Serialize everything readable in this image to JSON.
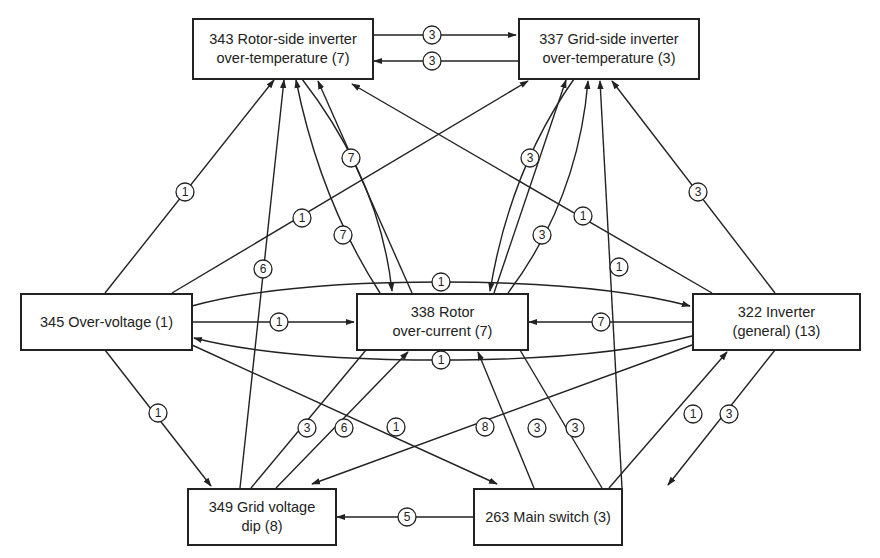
{
  "diagram": {
    "type": "fault-transition-graph",
    "nodes": [
      {
        "id": "n343",
        "line1": "343 Rotor-side inverter",
        "line2": "over-temperature (7)"
      },
      {
        "id": "n337",
        "line1": "337 Grid-side inverter",
        "line2": "over-temperature (3)"
      },
      {
        "id": "n345",
        "line1": "345 Over-voltage (1)",
        "line2": ""
      },
      {
        "id": "n338",
        "line1": "338 Rotor",
        "line2": "over-current (7)"
      },
      {
        "id": "n322",
        "line1": "322 Inverter",
        "line2": "(general) (13)"
      },
      {
        "id": "n349",
        "line1": "349 Grid voltage",
        "line2": "dip (8)"
      },
      {
        "id": "n263",
        "line1": "263 Main switch (3)",
        "line2": ""
      }
    ],
    "edges": [
      {
        "from": "343",
        "to": "337",
        "label": "3"
      },
      {
        "from": "337",
        "to": "343",
        "label": "3"
      },
      {
        "from": "345",
        "to": "343",
        "label": "1"
      },
      {
        "from": "345",
        "to": "337",
        "label": "1"
      },
      {
        "from": "349",
        "to": "343",
        "label": "6"
      },
      {
        "from": "343",
        "to": "338",
        "label": "7"
      },
      {
        "from": "338",
        "to": "343",
        "label": "7"
      },
      {
        "from": "338",
        "to": "343",
        "label": ""
      },
      {
        "from": "322",
        "to": "343",
        "label": "1"
      },
      {
        "from": "338",
        "to": "337",
        "label": "3"
      },
      {
        "from": "337",
        "to": "338",
        "label": "3"
      },
      {
        "from": "338",
        "to": "337",
        "label": ""
      },
      {
        "from": "263",
        "to": "337",
        "label": "1"
      },
      {
        "from": "322",
        "to": "337",
        "label": "3"
      },
      {
        "from": "345",
        "to": "322",
        "label": "1"
      },
      {
        "from": "322",
        "to": "345",
        "label": "1"
      },
      {
        "from": "345",
        "to": "338",
        "label": "1"
      },
      {
        "from": "322",
        "to": "338",
        "label": "7"
      },
      {
        "from": "345",
        "to": "349",
        "label": "1"
      },
      {
        "from": "345",
        "to": "263",
        "label": "1"
      },
      {
        "from": "322",
        "to": "349",
        "label": "8"
      },
      {
        "from": "338",
        "to": "349",
        "label": "3"
      },
      {
        "from": "349",
        "to": "338",
        "label": "6"
      },
      {
        "from": "263",
        "to": "338",
        "label": "3"
      },
      {
        "from": "338",
        "to": "263",
        "label": "3"
      },
      {
        "from": "263",
        "to": "322",
        "label": "1"
      },
      {
        "from": "322",
        "to": "263",
        "label": "3"
      },
      {
        "from": "263",
        "to": "349",
        "label": "5"
      }
    ]
  }
}
